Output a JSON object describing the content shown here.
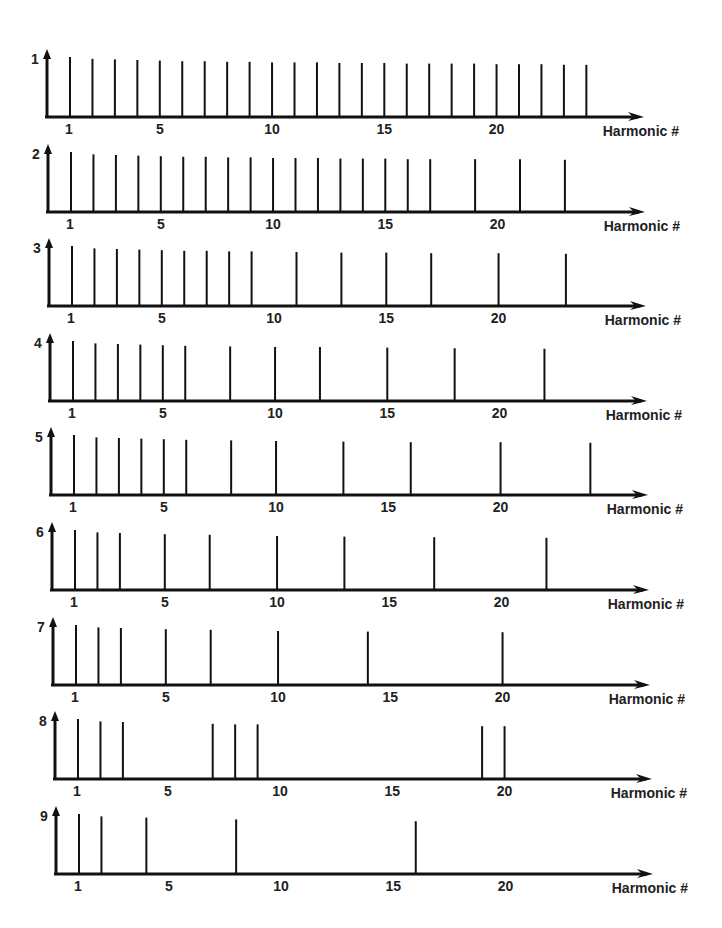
{
  "chart_data": {
    "type": "bar",
    "title": "",
    "xlabel": "Harmonic #",
    "ylabel": "",
    "xticks": [
      1,
      5,
      10,
      15,
      20
    ],
    "grid": false,
    "legend": "none",
    "panels": [
      {
        "label": "1",
        "harmonics": [
          1,
          2,
          3,
          4,
          5,
          6,
          7,
          8,
          9,
          10,
          11,
          12,
          13,
          14,
          15,
          16,
          17,
          18,
          19,
          20,
          21,
          22,
          23,
          24
        ],
        "heights": [
          1.0,
          0.97,
          0.96,
          0.95,
          0.94,
          0.93,
          0.93,
          0.92,
          0.92,
          0.91,
          0.91,
          0.91,
          0.9,
          0.9,
          0.9,
          0.89,
          0.89,
          0.89,
          0.89,
          0.88,
          0.88,
          0.88,
          0.87,
          0.87
        ]
      },
      {
        "label": "2",
        "harmonics": [
          1,
          2,
          3,
          4,
          5,
          6,
          7,
          8,
          9,
          10,
          11,
          12,
          13,
          14,
          15,
          16,
          17,
          19,
          21,
          23
        ],
        "heights": [
          1.0,
          0.96,
          0.95,
          0.94,
          0.93,
          0.92,
          0.92,
          0.91,
          0.91,
          0.9,
          0.9,
          0.9,
          0.89,
          0.89,
          0.89,
          0.88,
          0.88,
          0.88,
          0.88,
          0.87
        ]
      },
      {
        "label": "3",
        "harmonics": [
          1,
          2,
          3,
          4,
          5,
          6,
          7,
          8,
          9,
          11,
          13,
          15,
          17,
          20,
          23
        ],
        "heights": [
          1.0,
          0.96,
          0.95,
          0.94,
          0.93,
          0.92,
          0.92,
          0.91,
          0.91,
          0.9,
          0.89,
          0.89,
          0.88,
          0.88,
          0.87
        ]
      },
      {
        "label": "4",
        "harmonics": [
          1,
          2,
          3,
          4,
          5,
          6,
          8,
          10,
          12,
          15,
          18,
          22
        ],
        "heights": [
          1.0,
          0.96,
          0.95,
          0.94,
          0.93,
          0.92,
          0.91,
          0.9,
          0.9,
          0.89,
          0.88,
          0.87
        ]
      },
      {
        "label": "5",
        "harmonics": [
          1,
          2,
          3,
          4,
          5,
          6,
          8,
          10,
          13,
          16,
          20,
          24
        ],
        "heights": [
          1.0,
          0.96,
          0.95,
          0.94,
          0.93,
          0.92,
          0.91,
          0.9,
          0.89,
          0.88,
          0.88,
          0.87
        ]
      },
      {
        "label": "6",
        "harmonics": [
          1,
          2,
          3,
          5,
          7,
          10,
          13,
          17,
          22
        ],
        "heights": [
          1.0,
          0.96,
          0.95,
          0.93,
          0.92,
          0.9,
          0.89,
          0.88,
          0.87
        ]
      },
      {
        "label": "7",
        "harmonics": [
          1,
          2,
          3,
          5,
          7,
          10,
          14,
          20
        ],
        "heights": [
          1.0,
          0.96,
          0.95,
          0.93,
          0.92,
          0.9,
          0.89,
          0.88
        ]
      },
      {
        "label": "8",
        "harmonics": [
          1,
          2,
          3,
          7,
          8,
          9,
          19,
          20
        ],
        "heights": [
          1.0,
          0.96,
          0.95,
          0.92,
          0.91,
          0.91,
          0.88,
          0.88
        ]
      },
      {
        "label": "9",
        "harmonics": [
          1,
          2,
          4,
          8,
          16
        ],
        "heights": [
          1.0,
          0.96,
          0.94,
          0.91,
          0.88
        ]
      }
    ]
  }
}
